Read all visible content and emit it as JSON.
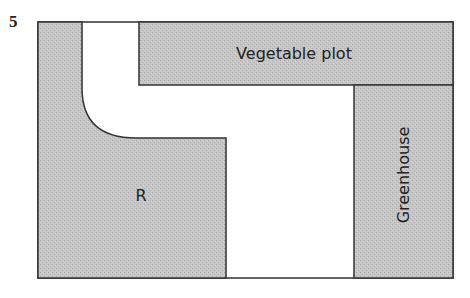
{
  "question_number": "5",
  "colors": {
    "shaded_fill": "#c4c4c4",
    "path_fill": "#ffffff",
    "outline": "#333333"
  },
  "regions": {
    "vegetable_plot": {
      "label": "Vegetable plot"
    },
    "greenhouse": {
      "label": "Greenhouse"
    },
    "region_r": {
      "label": "R"
    },
    "path": {
      "label": ""
    }
  }
}
